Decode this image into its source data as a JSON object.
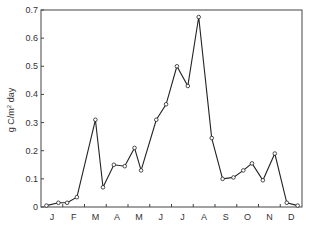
{
  "chart_data": {
    "type": "line",
    "title": "",
    "xlabel": "",
    "ylabel": "g C/m² day",
    "ylabel_parts": {
      "pre": "g C/m",
      "sup": "2",
      "post": " day"
    },
    "ylim": [
      0,
      0.7
    ],
    "yticks": [
      0,
      0.1,
      0.2,
      0.3,
      0.4,
      0.5,
      0.6,
      0.7
    ],
    "ytick_labels": [
      "0",
      "0.1",
      "0.2",
      "0.3",
      "0.4",
      "0.5",
      "0.6",
      "0.7"
    ],
    "xtick_labels": [
      "J",
      "F",
      "M",
      "A",
      "M",
      "J",
      "J",
      "A",
      "S",
      "O",
      "N",
      "D"
    ],
    "grid": false,
    "legend": null,
    "marker": "open-circle",
    "series": [
      {
        "name": "primary production",
        "x_month": [
          0.25,
          0.8,
          1.2,
          1.65,
          2.5,
          2.85,
          3.35,
          3.85,
          4.3,
          4.6,
          5.3,
          5.75,
          6.25,
          6.75,
          7.25,
          7.85,
          8.35,
          8.85,
          9.3,
          9.7,
          10.2,
          10.75,
          11.3,
          11.8
        ],
        "values": [
          0.005,
          0.015,
          0.015,
          0.035,
          0.31,
          0.07,
          0.15,
          0.145,
          0.21,
          0.13,
          0.31,
          0.365,
          0.5,
          0.43,
          0.675,
          0.245,
          0.1,
          0.105,
          0.13,
          0.155,
          0.095,
          0.19,
          0.015,
          0.005
        ]
      }
    ]
  }
}
